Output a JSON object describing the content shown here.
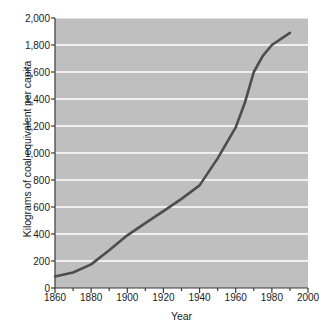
{
  "chart_data": {
    "type": "line",
    "title": "",
    "xlabel": "Year",
    "ylabel": "Kilograms of coal equivalent per capita",
    "xlim": [
      1860,
      2000
    ],
    "ylim": [
      0,
      2000
    ],
    "xticks": [
      1860,
      1880,
      1900,
      1920,
      1940,
      1960,
      1980,
      2000
    ],
    "xtick_labels": [
      "1860",
      "1880",
      "1900",
      "1920",
      "1940",
      "1960",
      "1980",
      "2000"
    ],
    "yticks": [
      0,
      200,
      400,
      600,
      800,
      1000,
      1200,
      1400,
      1600,
      1800,
      2000
    ],
    "ytick_labels": [
      "0",
      "200",
      "400",
      "600",
      "800",
      "1,000",
      "1,200",
      "1,400",
      "1,600",
      "1,800",
      "2,000"
    ],
    "x_minor_tick_step": 10,
    "grid": "horizontal-white-gridlines",
    "legend": "none",
    "plot_background": "#bfbfbf",
    "gridline_color": "#ffffff",
    "line_color": "#4d4d4d",
    "line_width": 2.6,
    "series": [
      {
        "name": "World energy consumption per capita",
        "x": [
          1860,
          1870,
          1880,
          1890,
          1900,
          1910,
          1920,
          1930,
          1940,
          1950,
          1960,
          1965,
          1970,
          1975,
          1980,
          1990
        ],
        "values": [
          85,
          115,
          175,
          280,
          390,
          480,
          570,
          660,
          760,
          960,
          1190,
          1370,
          1600,
          1720,
          1800,
          1890
        ]
      }
    ]
  },
  "axis": {
    "ylabel_text": "Kilograms of coal equivalent per capita",
    "xlabel_text": "Year"
  }
}
